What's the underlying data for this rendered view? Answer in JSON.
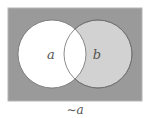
{
  "diagram": {
    "type": "venn",
    "universe": {
      "shaded": true,
      "color": "#9a9a9a"
    },
    "sets": [
      {
        "label": "a",
        "fill": "#ffffff",
        "shaded": false
      },
      {
        "label": "b",
        "fill": "#d2d2d2",
        "shaded": true
      }
    ],
    "intersection": {
      "fill": "#ffffff",
      "shaded": false
    },
    "outline_color": "#6e6e6e",
    "caption": "∼a"
  }
}
